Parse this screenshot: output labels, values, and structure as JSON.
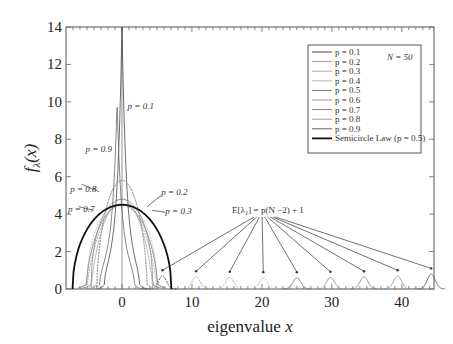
{
  "chart_data": {
    "type": "line",
    "title": "",
    "xlabel": "eigenvalue x",
    "ylabel": "f_λ(x)",
    "xlim": [
      -8,
      44.6
    ],
    "ylim": [
      0,
      14
    ],
    "xticks": [
      0,
      10,
      20,
      30,
      40
    ],
    "yticks": [
      0,
      2,
      4,
      6,
      8,
      10,
      12,
      14
    ],
    "grid": false,
    "legend_position": "upper right",
    "legend_entries": [
      "p = 0.1",
      "p = 0.2",
      "p = 0.3",
      "p = 0.4",
      "p = 0.5",
      "p = 0.6",
      "p = 0.7",
      "p = 0.8",
      "p = 0.9",
      "Semicircle Law (p = 0.5)"
    ],
    "legend_note": "N = 50",
    "series": [
      {
        "name": "p = 0.1",
        "peak_x": 0,
        "peak_y": 14.0,
        "bulk_halfwidth": 2.5,
        "outlier_x": 5.8,
        "outlier_peak": 0.7
      },
      {
        "name": "p = 0.2",
        "peak_x": 0,
        "peak_y": 5.8,
        "bulk_halfwidth": 3.6,
        "outlier_x": 10.6,
        "outlier_peak": 0.65
      },
      {
        "name": "p = 0.3",
        "peak_x": 0,
        "peak_y": 4.8,
        "bulk_halfwidth": 4.4,
        "outlier_x": 15.4,
        "outlier_peak": 0.62
      },
      {
        "name": "p = 0.4",
        "peak_x": 0,
        "peak_y": 4.55,
        "bulk_halfwidth": 5.0,
        "outlier_x": 20.2,
        "outlier_peak": 0.6
      },
      {
        "name": "p = 0.5",
        "peak_x": 0,
        "peak_y": 4.5,
        "bulk_halfwidth": 5.1,
        "outlier_x": 25.0,
        "outlier_peak": 0.6
      },
      {
        "name": "p = 0.6",
        "peak_x": 0,
        "peak_y": 4.55,
        "bulk_halfwidth": 5.0,
        "outlier_x": 29.8,
        "outlier_peak": 0.62
      },
      {
        "name": "p = 0.7",
        "peak_x": 0,
        "peak_y": 4.8,
        "bulk_halfwidth": 4.4,
        "outlier_x": 34.6,
        "outlier_peak": 0.65
      },
      {
        "name": "p = 0.8",
        "peak_x": 0,
        "peak_y": 5.8,
        "bulk_halfwidth": 3.6,
        "outlier_x": 39.4,
        "outlier_peak": 0.7
      },
      {
        "name": "p = 0.9",
        "peak_x": -0.7,
        "peak_y": 10.0,
        "bulk_halfwidth": 2.5,
        "outlier_x": 44.2,
        "outlier_peak": 0.8
      },
      {
        "name": "Semicircle Law (p = 0.5)",
        "center": 0,
        "radius": 7.07,
        "peak_y": 4.5
      }
    ],
    "annotations": [
      {
        "text": "p = 0.1",
        "x": 0.8,
        "y": 9.6
      },
      {
        "text": "p = 0.9",
        "x": -5.2,
        "y": 7.3
      },
      {
        "text": "p = 0.8",
        "x": -7.4,
        "y": 5.2
      },
      {
        "text": "p = 0.7",
        "x": -7.7,
        "y": 4.1
      },
      {
        "text": "p = 0.2",
        "x": 5.6,
        "y": 5.0
      },
      {
        "text": "p = 0.3",
        "x": 6.2,
        "y": 4.0
      },
      {
        "text": "E[λ1] = p(N − 2) + 1",
        "x": 22.0,
        "y": 1.3
      }
    ]
  },
  "labels": {
    "xlabel_main": "eigenvalue ",
    "xlabel_var": "x",
    "ylabel_f": "f",
    "ylabel_sub": "λ",
    "ylabel_rest": "(x)",
    "legend_note": "N = 50",
    "formula": "E[λ",
    "formula_sub": "1",
    "formula_rest": "] = p(N −2) + 1"
  }
}
